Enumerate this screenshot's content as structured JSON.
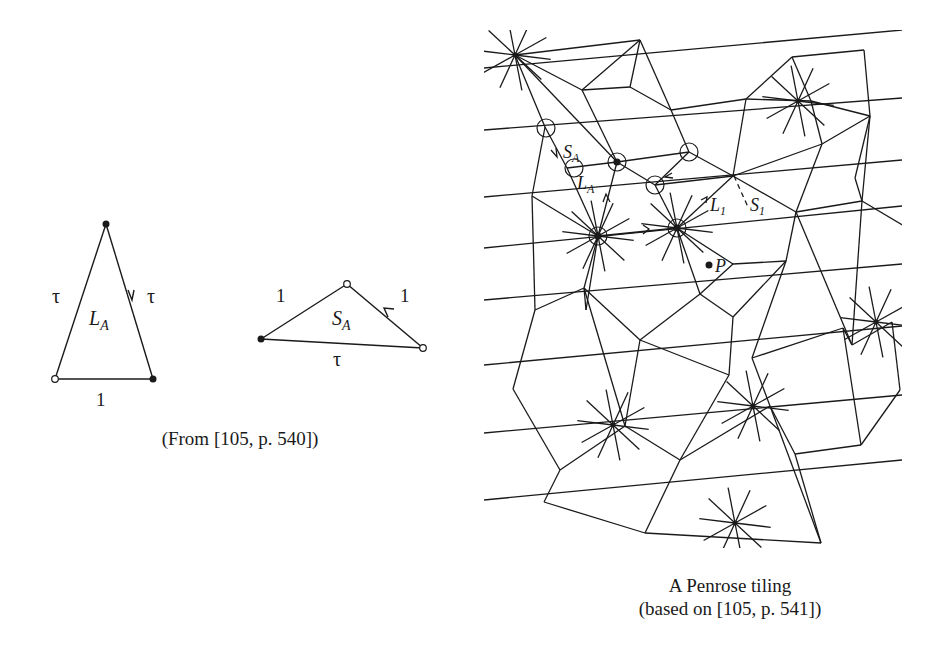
{
  "left_figure": {
    "large_tile": {
      "name": "L",
      "subscript": "A",
      "side_labels": {
        "left": "τ",
        "right": "τ",
        "base": "1"
      }
    },
    "small_tile": {
      "name": "S",
      "subscript": "A",
      "side_labels": {
        "left": "1",
        "right": "1",
        "base": "τ"
      }
    },
    "caption": "(From [105, p. 540])"
  },
  "right_figure": {
    "labels": {
      "SA": {
        "name": "S",
        "subscript": "A"
      },
      "LA": {
        "name": "L",
        "subscript": "A"
      },
      "L1": {
        "name": "L",
        "subscript": "1"
      },
      "S1": {
        "name": "S",
        "subscript": "1"
      },
      "P": "P"
    },
    "caption_line1": "A Penrose tiling",
    "caption_line2": "(based on [105, p. 541])"
  },
  "colors": {
    "ink": "#1a1a1a",
    "paper": "#ffffff"
  }
}
